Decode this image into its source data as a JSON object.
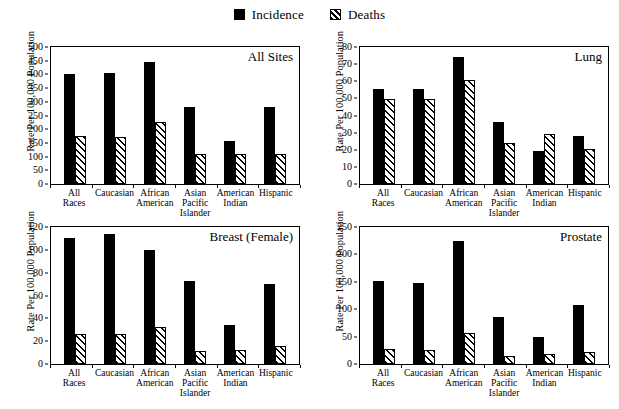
{
  "legend": {
    "items": [
      {
        "label": "Incidence",
        "swatch": "solid-black-square-icon"
      },
      {
        "label": "Deaths",
        "swatch": "hatched-square-icon"
      }
    ]
  },
  "axis_title": "Rate Per 100,000 Population",
  "categories": [
    "All\nRaces",
    "Caucasian",
    "African\nAmerican",
    "Asian\nPacific\nIslander",
    "American\nIndian",
    "Hispanic"
  ],
  "chart_data": [
    {
      "type": "bar",
      "title": "All Sites",
      "xlabel": "",
      "ylabel": "Rate Per 100,000 Population",
      "ylim": [
        0,
        500
      ],
      "yticks": [
        0,
        50,
        100,
        150,
        200,
        250,
        300,
        350,
        400,
        450,
        500
      ],
      "grid": false,
      "legend_position": "top-center",
      "categories": [
        "All Races",
        "Caucasian",
        "African American",
        "Asian Pacific Islander",
        "American Indian",
        "Hispanic"
      ],
      "series": [
        {
          "name": "Incidence",
          "values": [
            400,
            405,
            447,
            282,
            157,
            280
          ]
        },
        {
          "name": "Deaths",
          "values": [
            175,
            170,
            228,
            108,
            108,
            108
          ]
        }
      ]
    },
    {
      "type": "bar",
      "title": "Lung",
      "xlabel": "",
      "ylabel": "Rate Per 100,000 Population",
      "ylim": [
        0,
        80
      ],
      "yticks": [
        0,
        10,
        20,
        30,
        40,
        50,
        60,
        70,
        80
      ],
      "grid": false,
      "legend_position": "top-center",
      "categories": [
        "All Races",
        "Caucasian",
        "African American",
        "Asian Pacific Islander",
        "American Indian",
        "Hispanic"
      ],
      "series": [
        {
          "name": "Incidence",
          "values": [
            55.5,
            55.5,
            74,
            36,
            19,
            28
          ]
        },
        {
          "name": "Deaths",
          "values": [
            49.5,
            49.5,
            60.5,
            24,
            29,
            20.5
          ]
        }
      ]
    },
    {
      "type": "bar",
      "title": "Breast (Female)",
      "xlabel": "",
      "ylabel": "Rate Per 100,000 Population",
      "ylim": [
        0,
        120
      ],
      "yticks": [
        0,
        20,
        40,
        60,
        80,
        100,
        120
      ],
      "grid": false,
      "legend_position": "top-center",
      "categories": [
        "All Races",
        "Caucasian",
        "African American",
        "Asian Pacific Islander",
        "American Indian",
        "Hispanic"
      ],
      "series": [
        {
          "name": "Incidence",
          "values": [
            110,
            114,
            99.5,
            73,
            34,
            70
          ]
        },
        {
          "name": "Deaths",
          "values": [
            26,
            26,
            32,
            11.5,
            12.5,
            16
          ]
        }
      ]
    },
    {
      "type": "bar",
      "title": "Prostate",
      "xlabel": "",
      "ylabel": "Rate Per 100,000 Population",
      "ylim": [
        0,
        250
      ],
      "yticks": [
        0,
        50,
        100,
        150,
        200,
        250
      ],
      "grid": false,
      "legend_position": "top-center",
      "categories": [
        "All Races",
        "Caucasian",
        "African American",
        "Asian Pacific Islander",
        "American Indian",
        "Hispanic"
      ],
      "series": [
        {
          "name": "Incidence",
          "values": [
            152,
            147,
            224,
            85,
            50,
            108
          ]
        },
        {
          "name": "Deaths",
          "values": [
            28,
            26,
            57,
            15,
            19,
            22
          ]
        }
      ]
    }
  ]
}
